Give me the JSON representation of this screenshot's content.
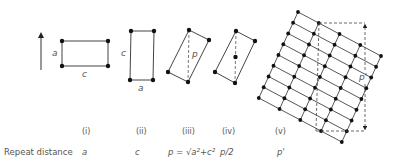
{
  "figure": {
    "row_label": "Repeat distance",
    "direction_arrow": "up",
    "panels": [
      {
        "numeral": "(i)",
        "repeat": "a",
        "edge_labels": [
          "a",
          "c"
        ]
      },
      {
        "numeral": "(ii)",
        "repeat": "c",
        "edge_labels": [
          "c",
          "a"
        ]
      },
      {
        "numeral": "(iii)",
        "repeat": "p = √a²+c²",
        "edge_labels": [
          "p"
        ]
      },
      {
        "numeral": "(iv)",
        "repeat": "p/2",
        "edge_labels": []
      },
      {
        "numeral": "(v)",
        "repeat": "p'",
        "edge_labels": [
          "p'"
        ]
      }
    ],
    "lattice": {
      "rows": 9,
      "cols": 5
    },
    "colors": {
      "line": "#444444",
      "text": "#555555",
      "dot": "#111111"
    }
  }
}
